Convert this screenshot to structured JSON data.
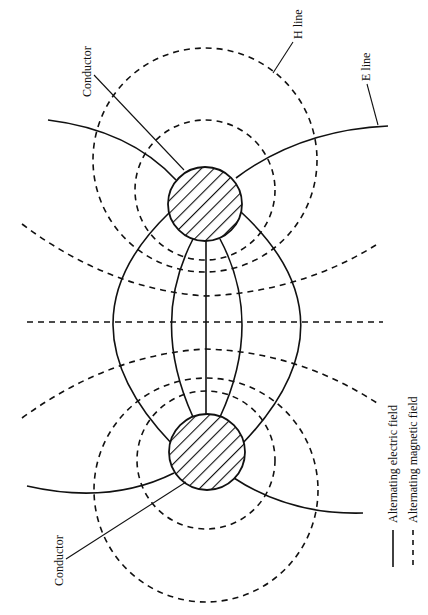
{
  "diagram": {
    "type": "field-lines",
    "labels": {
      "conductor_top": "Conductor",
      "conductor_bottom": "Conductor",
      "h_line": "H line",
      "e_line": "E line"
    },
    "legend": [
      {
        "style": "solid",
        "label": "Alternating electric field"
      },
      {
        "style": "dashed",
        "label": "Alternating magnetic field"
      }
    ],
    "colors": {
      "stroke": "#111111",
      "background": "#ffffff"
    },
    "conductors": [
      {
        "id": "top",
        "cx": 205,
        "cy": 204,
        "r": 37
      },
      {
        "id": "bottom",
        "cx": 207,
        "cy": 452,
        "r": 38
      }
    ]
  }
}
